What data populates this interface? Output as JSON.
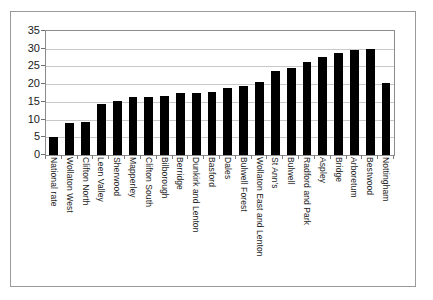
{
  "figure": {
    "frame_color": "#9a9a9a",
    "plot_border_color": "#8c8c8c",
    "gridline_color": "#c8c8c8",
    "bar_color": "#0a0a0a",
    "background_color": "#ffffff"
  },
  "chart_data": {
    "type": "bar",
    "title": "",
    "subtitle": "",
    "xlabel": "",
    "ylabel": "",
    "ylim": [
      0,
      35
    ],
    "ytick_values": [
      0,
      5,
      10,
      15,
      20,
      25,
      30,
      35
    ],
    "ytick_labels": [
      "0",
      "5",
      "10",
      "15",
      "20",
      "25",
      "30",
      "35"
    ],
    "ystep": 5,
    "grid": true,
    "grid_axis": "y",
    "legend": false,
    "legend_position": "none",
    "xtick_label_rotation": 90,
    "bar_color": "#000000",
    "categories": [
      "National rate",
      "Wollaton West",
      "Clifton North",
      "Leen Valley",
      "Sherwood",
      "Mapperley",
      "Clifton South",
      "Bilborough",
      "Berridge",
      "Dunkirk and Lenton",
      "Basford",
      "Dales",
      "Bulwell Forest",
      "Wollaton East and Lenton",
      "St Ann's",
      "Bulwell",
      "Radford and Park",
      "Aspley",
      "Bridge",
      "Arboretum",
      "Bestwood",
      "Nottingham"
    ],
    "values": [
      5.1,
      9.0,
      9.3,
      14.5,
      15.2,
      16.5,
      16.5,
      16.6,
      17.4,
      17.4,
      17.8,
      19.0,
      19.4,
      20.6,
      23.8,
      24.5,
      26.2,
      27.8,
      28.7,
      29.6,
      29.8,
      20.4
    ]
  }
}
